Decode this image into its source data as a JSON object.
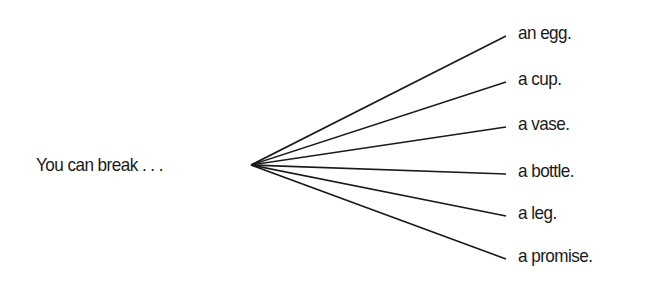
{
  "diagram": {
    "stem": "You can break . . .",
    "origin": {
      "x": 251,
      "y": 165
    },
    "branches": [
      {
        "label": "an egg.",
        "x": 506,
        "y": 36,
        "ty": 22
      },
      {
        "label": "a cup.",
        "x": 506,
        "y": 82,
        "ty": 68
      },
      {
        "label": "a vase.",
        "x": 506,
        "y": 127,
        "ty": 113
      },
      {
        "label": "a bottle.",
        "x": 506,
        "y": 174,
        "ty": 160
      },
      {
        "label": "a leg.",
        "x": 506,
        "y": 216,
        "ty": 202
      },
      {
        "label": "a promise.",
        "x": 506,
        "y": 259,
        "ty": 245
      }
    ],
    "line_color": "#1a1a1a"
  }
}
